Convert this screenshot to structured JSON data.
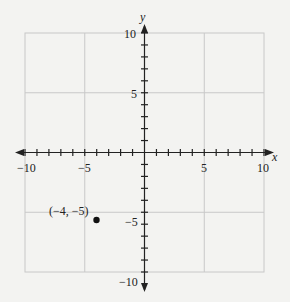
{
  "chart_data": {
    "type": "scatter",
    "title": "",
    "xlabel": "x",
    "ylabel": "y",
    "xlim": [
      -10,
      10
    ],
    "ylim": [
      -10,
      10
    ],
    "grid": true,
    "grid_spacing": 5,
    "tick_spacing": 1,
    "x_tick_labels": [
      "-10",
      "-5",
      "5",
      "10"
    ],
    "y_tick_labels": [
      "10",
      "5",
      "-5",
      "-10"
    ],
    "points": [
      {
        "x": -4,
        "y": -5,
        "label": "(−4, −5)"
      }
    ],
    "colors": {
      "background": "#f3f3f1",
      "grid": "#c8c8c8",
      "axis": "#222222",
      "point": "#111111"
    }
  },
  "labels": {
    "x_axis": "x",
    "y_axis": "y",
    "x_neg10": "−10",
    "x_neg5": "−5",
    "x_5": "5",
    "x_10": "10",
    "y_10": "10",
    "y_5": "5",
    "y_neg5": "−5",
    "y_neg10": "−10",
    "point_label": "(−4, −5)"
  }
}
